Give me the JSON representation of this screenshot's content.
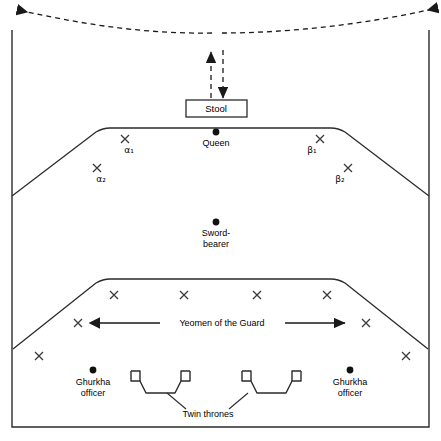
{
  "figure": {
    "type": "ceremonial-seating-plan-diagram",
    "background_color": "#ffffff",
    "line_color": "#2b2b2b",
    "text_color": "#000000"
  },
  "labels": {
    "stool": "Stool",
    "queen": "Queen",
    "sword_bearer": "Sword-\nbearer",
    "yeomen": "Yeomen of the Guard",
    "ghurkha_officer_left": "Ghurkha\nofficer",
    "ghurkha_officer_right": "Ghurkha\nofficer",
    "twin_thrones": "Twin thrones",
    "alpha1": "α₁",
    "alpha2": "α₂",
    "beta1": "β₁",
    "beta2": "β₂"
  },
  "markers": {
    "dot_positions": [
      {
        "name": "queen",
        "x": 216,
        "y": 132
      },
      {
        "name": "sword-bearer",
        "x": 216,
        "y": 222
      },
      {
        "name": "ghurkha-officer-left",
        "x": 93,
        "y": 370
      },
      {
        "name": "ghurkha-officer-right",
        "x": 350,
        "y": 370
      }
    ],
    "cross_positions": [
      {
        "name": "alpha1",
        "x": 125,
        "y": 139
      },
      {
        "name": "alpha2",
        "x": 97,
        "y": 168
      },
      {
        "name": "beta1",
        "x": 320,
        "y": 139
      },
      {
        "name": "beta2",
        "x": 348,
        "y": 168
      },
      {
        "name": "yeoman-row1-1",
        "x": 114,
        "y": 295
      },
      {
        "name": "yeoman-row1-2",
        "x": 184,
        "y": 295
      },
      {
        "name": "yeoman-row1-3",
        "x": 257,
        "y": 295
      },
      {
        "name": "yeoman-row1-4",
        "x": 327,
        "y": 295
      },
      {
        "name": "yeoman-row2-left",
        "x": 78,
        "y": 323
      },
      {
        "name": "yeoman-row2-right",
        "x": 366,
        "y": 323
      },
      {
        "name": "corner-left",
        "x": 39,
        "y": 356
      },
      {
        "name": "corner-right",
        "x": 406,
        "y": 356
      }
    ]
  },
  "shapes": {
    "outer_frame": {
      "left": 12,
      "top": 30,
      "right": 429,
      "bottom": 427
    },
    "upper_platform": {
      "apex_left_x": 103,
      "apex_right_x": 338,
      "top_y": 128,
      "base_y": 196
    },
    "lower_platform": {
      "apex_left_x": 103,
      "apex_right_x": 338,
      "top_y": 279,
      "base_y": 349
    },
    "stool_box": {
      "left": 186,
      "top": 100,
      "right": 247,
      "bottom": 117
    },
    "thrones": [
      {
        "name": "throne-left",
        "cx": 152,
        "cy": 385
      },
      {
        "name": "throne-right",
        "cx": 263,
        "cy": 385
      }
    ]
  },
  "arrows": {
    "procession_arc": "dashed curved route across top with two left-pointing arrowheads",
    "entry_up": "dashed vertical arrow pointing up",
    "entry_down": "dashed vertical arrow pointing down",
    "yeomen_span": "double-headed horizontal arrow spanning the Yeomen row"
  }
}
